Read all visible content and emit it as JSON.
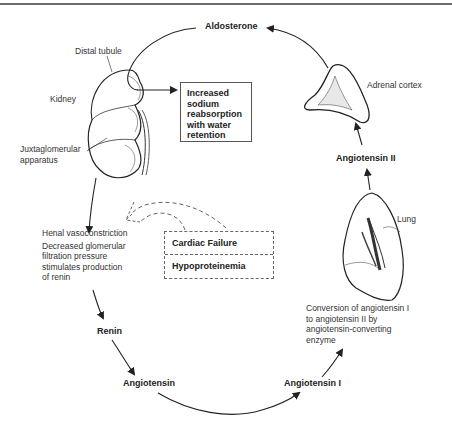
{
  "diagram": {
    "organs": {
      "kidney": "Kidney",
      "distal_tubule": "Distal tubule",
      "juxtaglomerular": [
        "Juxtaglomerular",
        "apparatus"
      ],
      "adrenal": "Adrenal cortex",
      "lung": "Lung"
    },
    "nodes": {
      "aldosterone": "Aldosterone",
      "angiotensin_ii": "Angiotensin II",
      "angiotensin_i": "Angiotensin I",
      "angiotensin": "Angiotensin",
      "renin": "Renin"
    },
    "effect_box": [
      "Increased",
      "sodium",
      "reabsorption",
      "with water",
      "retention"
    ],
    "renal_text": {
      "line1": "Henal vasoconstriction",
      "lines": [
        "Decreased glomerular",
        "filtration pressure",
        "stimulates production",
        "of renin"
      ]
    },
    "conversion_text": [
      "Conversion of angiotensin I",
      "to angiotensin II by",
      "angiotensin-converting",
      "enzyme"
    ],
    "causes": {
      "cause1": "Cardiac Failure",
      "cause2": "Hypoproteinemia"
    }
  }
}
